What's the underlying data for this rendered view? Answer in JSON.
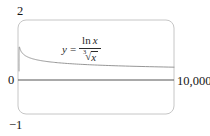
{
  "figure": {
    "y_max_label": "2",
    "origin_label": "0",
    "y_min_label": "−1",
    "x_max_label": "10,000"
  },
  "formula": {
    "lhs": "y",
    "equals": "=",
    "num_fn": "ln",
    "num_var": "x",
    "root_index": "3",
    "radical_sign": "√",
    "radicand": "x"
  },
  "chart_data": {
    "type": "line",
    "title": "",
    "xlabel": "",
    "ylabel": "",
    "expression": "y = ln(x)/cbrt(x)",
    "x_range": [
      0,
      10000
    ],
    "y_range": [
      -1,
      2
    ],
    "x_tick_labels": [
      "10,000"
    ],
    "y_tick_labels": [
      "2",
      "0",
      "−1"
    ],
    "grid": false,
    "legend": false,
    "frame_style": "rounded-viewing-rectangle",
    "key_points": [
      {
        "x": 2,
        "y": 0.55
      },
      {
        "x": 20,
        "y": 1.1
      },
      {
        "x": 100,
        "y": 0.99
      },
      {
        "x": 500,
        "y": 0.78
      },
      {
        "x": 1000,
        "y": 0.69
      },
      {
        "x": 2500,
        "y": 0.58
      },
      {
        "x": 5000,
        "y": 0.5
      },
      {
        "x": 7500,
        "y": 0.46
      },
      {
        "x": 10000,
        "y": 0.43
      }
    ],
    "colors": {
      "curve": "#979797",
      "axis": "#555555",
      "frame": "#c6c6c6",
      "text": "#151515",
      "background": "#ffffff"
    }
  }
}
